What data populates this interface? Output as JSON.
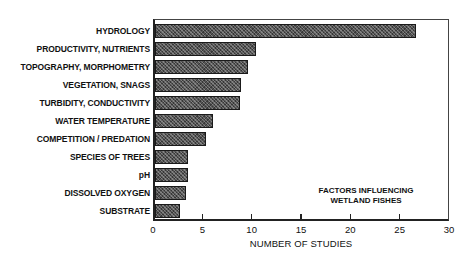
{
  "chart_data": {
    "type": "bar",
    "orientation": "horizontal",
    "title": "",
    "annotation": [
      "FACTORS INFLUENCING",
      "WETLAND FISHES"
    ],
    "xlabel": "NUMBER OF STUDIES",
    "ylabel": "",
    "xlim": [
      0,
      30
    ],
    "xticks": [
      0,
      5,
      10,
      15,
      20,
      25,
      30
    ],
    "grid": false,
    "legend": null,
    "categories": [
      "HYDROLOGY",
      "PRODUCTIVITY, NUTRIENTS",
      "TOPOGRAPHY, MORPHOMETRY",
      "VEGETATION, SNAGS",
      "TURBIDITY, CONDUCTIVITY",
      "WATER TEMPERATURE",
      "COMPETITION / PREDATION",
      "SPECIES OF TREES",
      "pH",
      "DISSOLVED OXYGEN",
      "SUBSTRATE"
    ],
    "values": [
      26.7,
      10.5,
      9.6,
      8.9,
      8.8,
      6.1,
      5.4,
      3.6,
      3.6,
      3.4,
      2.7
    ]
  },
  "layout": {
    "x0_px": 155,
    "px_per_unit": 9.85,
    "first_row_top": 24,
    "row_step": 18
  }
}
